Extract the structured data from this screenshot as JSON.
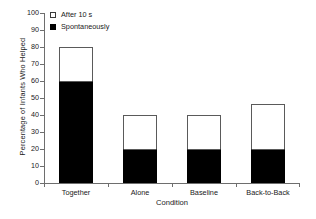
{
  "chart_data": {
    "type": "bar",
    "variant": "stacked-vertical",
    "title": "",
    "xlabel": "Condition",
    "ylabel": "Percentage of Infants Who Helped",
    "categories": [
      "Together",
      "Alone",
      "Baseline",
      "Back-to-Back"
    ],
    "series": [
      {
        "name": "Spontaneously",
        "color": "#000000",
        "values": [
          60,
          20,
          20,
          20
        ]
      },
      {
        "name": "After 10 s",
        "color": "#ffffff",
        "values": [
          20,
          20,
          20,
          26.5
        ]
      }
    ],
    "totals": [
      80,
      40,
      40,
      46.5
    ],
    "ylim": [
      0,
      100
    ],
    "yticks": [
      0,
      10,
      20,
      30,
      40,
      50,
      60,
      70,
      80,
      90,
      100
    ],
    "yticklabels": [
      "0",
      "10",
      "20",
      "30",
      "40",
      "50",
      "60",
      "70",
      "80",
      "90",
      "100"
    ],
    "grid": false,
    "legend_position": "upper-left",
    "legend_entries": [
      {
        "label": "After 10 s",
        "swatch": "hollow"
      },
      {
        "label": "Spontaneously",
        "swatch": "filled"
      }
    ],
    "axis_color": "#6e6e6e",
    "background": "#ffffff"
  },
  "legend": {
    "entry0_label": "After 10 s",
    "entry1_label": "Spontaneously"
  },
  "axes": {
    "ylabel": "Percentage of Infants Who Helped",
    "xlabel": "Condition",
    "yticklabels": [
      "0",
      "10",
      "20",
      "30",
      "40",
      "50",
      "60",
      "70",
      "80",
      "90",
      "100"
    ],
    "xticklabels": [
      "Together",
      "Alone",
      "Baseline",
      "Back-to-Back"
    ]
  }
}
